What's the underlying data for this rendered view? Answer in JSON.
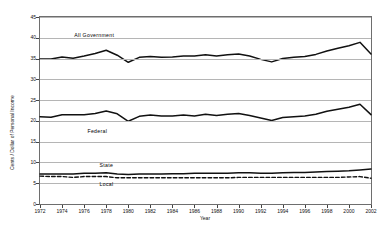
{
  "chart_data": {
    "type": "line",
    "title": "",
    "xlabel": "Year",
    "ylabel": "Cents / Dollar of Personal Income",
    "xlim": [
      1972,
      2002
    ],
    "ylim": [
      0,
      45
    ],
    "grid": true,
    "legend_position": "inline-labels",
    "x": [
      1972,
      1973,
      1974,
      1975,
      1976,
      1977,
      1978,
      1979,
      1980,
      1981,
      1982,
      1983,
      1984,
      1985,
      1986,
      1987,
      1988,
      1989,
      1990,
      1991,
      1992,
      1993,
      1994,
      1995,
      1996,
      1997,
      1998,
      1999,
      2000,
      2001,
      2002
    ],
    "xticks": [
      1972,
      1974,
      1976,
      1978,
      1980,
      1982,
      1984,
      1986,
      1988,
      1990,
      1992,
      1994,
      1996,
      1998,
      2000,
      2002
    ],
    "yticks": [
      0,
      5,
      10,
      15,
      20,
      25,
      30,
      35,
      40,
      45
    ],
    "series": [
      {
        "name": "All Government",
        "style": "solid",
        "color": "#111111",
        "label_x": 1975.1,
        "label_y": 40.7,
        "values": [
          34.9,
          34.9,
          35.4,
          35.1,
          35.6,
          36.2,
          37.0,
          35.8,
          34.1,
          35.3,
          35.5,
          35.3,
          35.4,
          35.6,
          35.6,
          35.9,
          35.6,
          35.9,
          36.1,
          35.6,
          34.8,
          34.2,
          35.0,
          35.3,
          35.5,
          36.0,
          36.8,
          37.5,
          38.1,
          38.9,
          36.1
        ]
      },
      {
        "name": "Federal",
        "style": "solid",
        "color": "#111111",
        "label_x": 1976.3,
        "label_y": 17.6,
        "values": [
          21.0,
          20.9,
          21.5,
          21.5,
          21.5,
          21.8,
          22.4,
          21.7,
          19.9,
          21.1,
          21.4,
          21.2,
          21.2,
          21.4,
          21.2,
          21.6,
          21.3,
          21.6,
          21.8,
          21.3,
          20.7,
          20.1,
          20.8,
          21.0,
          21.2,
          21.6,
          22.3,
          22.8,
          23.3,
          24.0,
          21.5
        ]
      },
      {
        "name": "State",
        "style": "solid",
        "color": "#111111",
        "label_x": 1977.4,
        "label_y": 9.4,
        "values": [
          7.2,
          7.2,
          7.2,
          7.2,
          7.4,
          7.4,
          7.5,
          7.2,
          7.1,
          7.2,
          7.2,
          7.2,
          7.3,
          7.3,
          7.4,
          7.4,
          7.4,
          7.4,
          7.5,
          7.5,
          7.4,
          7.4,
          7.5,
          7.6,
          7.6,
          7.7,
          7.8,
          7.9,
          8.0,
          8.2,
          8.4
        ]
      },
      {
        "name": "Local",
        "style": "dashed",
        "color": "#111111",
        "label_x": 1977.4,
        "label_y": 4.9,
        "values": [
          6.7,
          6.6,
          6.6,
          6.4,
          6.6,
          6.6,
          6.6,
          6.3,
          6.3,
          6.3,
          6.3,
          6.3,
          6.3,
          6.3,
          6.3,
          6.3,
          6.3,
          6.3,
          6.4,
          6.4,
          6.4,
          6.4,
          6.4,
          6.4,
          6.4,
          6.4,
          6.4,
          6.4,
          6.5,
          6.6,
          6.2
        ]
      }
    ]
  }
}
